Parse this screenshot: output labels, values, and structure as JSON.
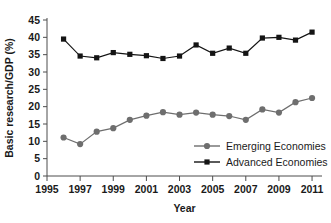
{
  "chart_data": {
    "type": "line",
    "title": "",
    "xlabel": "Year",
    "ylabel": "Basic research/GDP (%)",
    "xlim": [
      1995,
      2011.6
    ],
    "ylim": [
      0,
      45
    ],
    "xticks": [
      "1995",
      "1997",
      "1999",
      "2001",
      "2003",
      "2005",
      "2007",
      "2009",
      "2011"
    ],
    "yticks": [
      "0",
      "5",
      "10",
      "15",
      "20",
      "25",
      "30",
      "35",
      "40",
      "45"
    ],
    "grid": false,
    "legend_position": "inside-lower-right",
    "x": [
      1996,
      1997,
      1998,
      1999,
      2000,
      2001,
      2002,
      2003,
      2004,
      2005,
      2006,
      2007,
      2008,
      2009,
      2010,
      2011
    ],
    "series": [
      {
        "name": "Emerging Economies",
        "marker": "circle",
        "color": "#6e6e6e",
        "values": [
          11.1,
          9.2,
          12.8,
          13.8,
          16.2,
          17.4,
          18.4,
          17.7,
          18.3,
          17.7,
          17.3,
          16.2,
          19.2,
          18.3,
          21.3,
          22.5
        ]
      },
      {
        "name": "Advanced Economies",
        "marker": "square",
        "color": "#141414",
        "values": [
          39.5,
          34.6,
          34.1,
          35.6,
          35.1,
          34.7,
          33.9,
          34.6,
          37.8,
          35.4,
          36.9,
          35.4,
          39.8,
          40.0,
          39.2,
          41.5
        ]
      }
    ]
  },
  "legend": {
    "items": [
      {
        "label": "Emerging Economies"
      },
      {
        "label": "Advanced Economies"
      }
    ]
  },
  "axes": {
    "x_title": "Year",
    "y_title": "Basic research/GDP (%)"
  }
}
